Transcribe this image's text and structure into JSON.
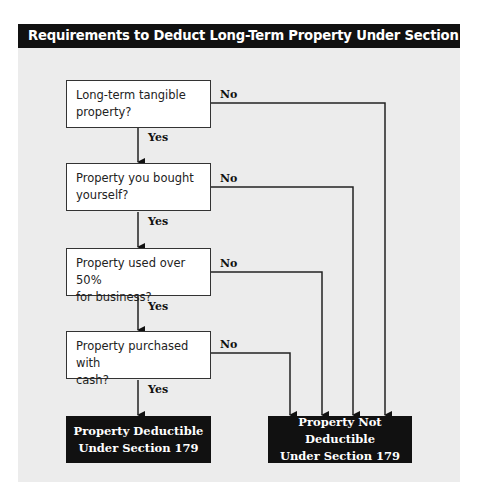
{
  "title": "Requirements to Deduct Long-Term Property Under Section 179",
  "questions": [
    {
      "line1": "Long-term tangible",
      "line2": "property?"
    },
    {
      "line1": "Property you bought",
      "line2": "yourself?"
    },
    {
      "line1": "Property used over 50%",
      "line2": "for business?"
    },
    {
      "line1": "Property purchased with",
      "line2": "cash?"
    }
  ],
  "labels": {
    "yes": "Yes",
    "no": "No"
  },
  "results": {
    "deductible": {
      "line1": "Property Deductible",
      "line2": "Under Section 179"
    },
    "not_deductible": {
      "line1": "Property Not Deductible",
      "line2": "Under Section 179"
    }
  },
  "colors": {
    "title_bg": "#111111",
    "panel_bg": "#ececec",
    "box_border": "#333333",
    "result_bg": "#111111"
  }
}
